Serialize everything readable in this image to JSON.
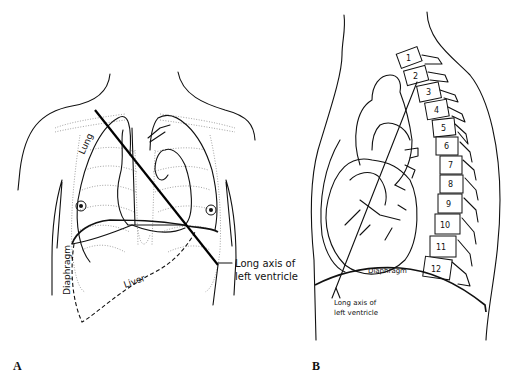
{
  "figure": {
    "panels": [
      {
        "id": "A",
        "letter": "A",
        "view": "frontal",
        "labels": {
          "lung": "Lung",
          "liver": "Liver",
          "diaphragm": "Diaphragm",
          "axis_line1": "Long axis of",
          "axis_line2": "left ventricle"
        }
      },
      {
        "id": "B",
        "letter": "B",
        "view": "lateral",
        "labels": {
          "diaphragm": "Diaphragm",
          "axis_line1": "Long axis of",
          "axis_line2": "left ventricle"
        },
        "vertebrae": [
          "1",
          "2",
          "3",
          "4",
          "5",
          "6",
          "7",
          "8",
          "9",
          "10",
          "11",
          "12"
        ]
      }
    ]
  }
}
